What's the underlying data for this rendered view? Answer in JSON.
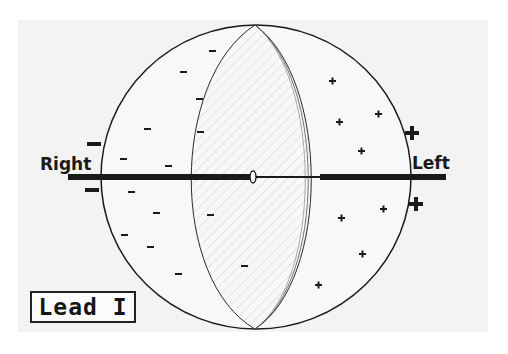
{
  "diagram": {
    "title": "Lead I",
    "labels": {
      "right": "Right",
      "left": "Left"
    },
    "colors": {
      "background": "#f3f3f3",
      "ink": "#1a1a1a",
      "hatch": "#c8c8c8"
    },
    "electrodes": [
      {
        "side": "right",
        "polarity": "negative",
        "symbols": [
          "−",
          "−"
        ]
      },
      {
        "side": "left",
        "polarity": "positive",
        "symbols": [
          "+",
          "+"
        ]
      }
    ],
    "regions": [
      {
        "name": "negative-region",
        "sign": "−",
        "count": 14
      },
      {
        "name": "depolarization-wavefront",
        "pattern": "hatched"
      },
      {
        "name": "positive-region",
        "sign": "+",
        "count": 8
      }
    ]
  }
}
